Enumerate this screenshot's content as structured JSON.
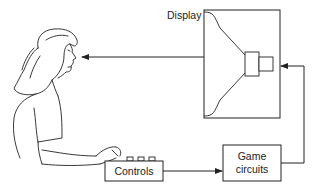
{
  "diagram": {
    "title": "",
    "nodes": {
      "display": {
        "label": "Display"
      },
      "controls": {
        "label": "Controls"
      },
      "game_circuits": {
        "label_line1": "Game",
        "label_line2": "circuits"
      },
      "player": {
        "label": ""
      }
    },
    "edges": [
      {
        "from": "display",
        "to": "player"
      },
      {
        "from": "controls",
        "to": "game_circuits"
      },
      {
        "from": "game_circuits",
        "to": "display"
      }
    ],
    "colors": {
      "stroke": "#222222",
      "background": "#ffffff"
    }
  }
}
